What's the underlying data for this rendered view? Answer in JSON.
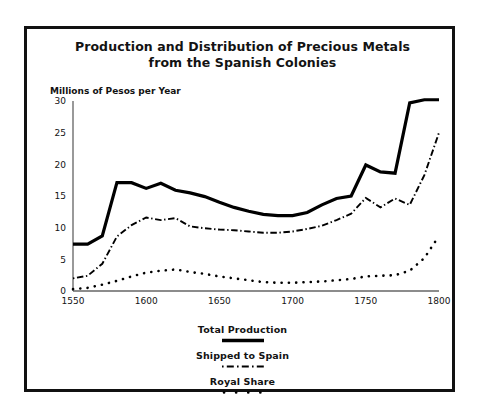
{
  "chart_data": {
    "type": "line",
    "title": "Production and Distribution of Precious Metals from the Spanish Colonies",
    "title_line1": "Production and Distribution of Precious Metals",
    "title_line2": "from the Spanish Colonies",
    "ylabel": "Millions of Pesos per Year",
    "xlabel": "",
    "xlim": [
      1550,
      1800
    ],
    "ylim": [
      0,
      30
    ],
    "grid": false,
    "legend_position": "below-plot-center",
    "xticks": [
      1550,
      1600,
      1650,
      1700,
      1750,
      1800
    ],
    "xtick_labels": [
      "1550",
      "1600",
      "1650",
      "1700",
      "1750",
      "1800"
    ],
    "yticks": [
      0,
      5,
      10,
      15,
      20,
      25,
      30
    ],
    "ytick_labels": [
      "0",
      "5",
      "10",
      "15",
      "20",
      "25",
      "30"
    ],
    "x": [
      1550,
      1560,
      1570,
      1580,
      1590,
      1600,
      1610,
      1620,
      1630,
      1640,
      1650,
      1660,
      1670,
      1680,
      1690,
      1700,
      1710,
      1720,
      1730,
      1740,
      1750,
      1760,
      1770,
      1780,
      1790,
      1800
    ],
    "series": [
      {
        "name": "Total Production",
        "style": "solid",
        "color": "#000000",
        "values": [
          7.4,
          7.4,
          8.7,
          17.1,
          17.1,
          16.2,
          17.0,
          15.9,
          15.5,
          14.9,
          14.0,
          13.2,
          12.6,
          12.1,
          11.9,
          11.9,
          12.4,
          13.6,
          14.6,
          15.0,
          19.9,
          18.8,
          18.6,
          29.7,
          30.2,
          30.2
        ]
      },
      {
        "name": "Shipped to Spain",
        "style": "dashdot",
        "color": "#000000",
        "values": [
          2.0,
          2.4,
          4.3,
          8.6,
          10.4,
          11.6,
          11.2,
          11.5,
          10.2,
          9.9,
          9.7,
          9.6,
          9.4,
          9.2,
          9.2,
          9.4,
          9.8,
          10.3,
          11.2,
          12.2,
          14.7,
          13.2,
          14.6,
          13.6,
          18.3,
          25.0
        ]
      },
      {
        "name": "Royal Share",
        "style": "dotted",
        "color": "#000000",
        "values": [
          0.3,
          0.5,
          1.0,
          1.6,
          2.3,
          2.9,
          3.2,
          3.4,
          3.0,
          2.7,
          2.3,
          2.0,
          1.7,
          1.4,
          1.3,
          1.3,
          1.4,
          1.5,
          1.7,
          1.9,
          2.3,
          2.4,
          2.5,
          3.2,
          5.2,
          8.7
        ]
      }
    ]
  },
  "legend": {
    "total_production": "Total Production",
    "shipped_to_spain": "Shipped to Spain",
    "royal_share": "Royal Share"
  }
}
